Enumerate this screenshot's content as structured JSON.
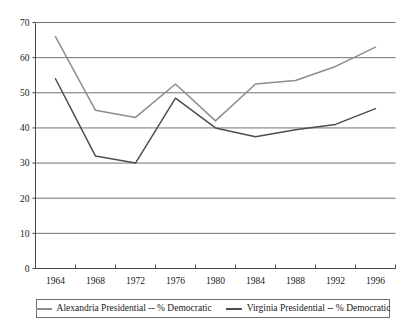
{
  "chart_data": {
    "type": "line",
    "title": "",
    "subtitle": "",
    "xlabel": "",
    "ylabel": "",
    "categories": [
      "1964",
      "1968",
      "1972",
      "1976",
      "1980",
      "1984",
      "1988",
      "1992",
      "1996"
    ],
    "series": [
      {
        "name": "Alexandria Presidential -- % Democratic",
        "color": "#8d8d8d",
        "values": [
          66,
          45,
          43,
          52.5,
          42,
          52.5,
          53.5,
          57.5,
          63
        ]
      },
      {
        "name": "Virginia Presidential -- % Democratic",
        "color": "#4d4d4d",
        "values": [
          54,
          32,
          30,
          48.5,
          40,
          37.5,
          39.5,
          41,
          45.5
        ]
      }
    ],
    "ylim": [
      0,
      70
    ],
    "yticks": [
      0,
      10,
      20,
      30,
      40,
      50,
      60,
      70
    ],
    "ytick_labels": [
      "0",
      "10",
      "20",
      "30",
      "40",
      "50",
      "60",
      "70"
    ],
    "grid": true,
    "grid_axis": "y",
    "legend_position": "bottom"
  },
  "legend": {
    "entries": [
      {
        "label": "Alexandria Presidential -- % Democratic"
      },
      {
        "label": "Virginia Presidential -- % Democratic"
      }
    ]
  },
  "axes": {
    "y_labels": [
      "70",
      "60",
      "50",
      "40",
      "30",
      "20",
      "10",
      "0"
    ],
    "x_labels": [
      "1964",
      "1968",
      "1972",
      "1976",
      "1980",
      "1984",
      "1988",
      "1992",
      "1996"
    ]
  },
  "colors": {
    "series_alexandria": "#8d8d8d",
    "series_virginia": "#4d4d4d",
    "gridline": "#737373",
    "axis": "#4a4a4a",
    "background": "#ffffff"
  }
}
